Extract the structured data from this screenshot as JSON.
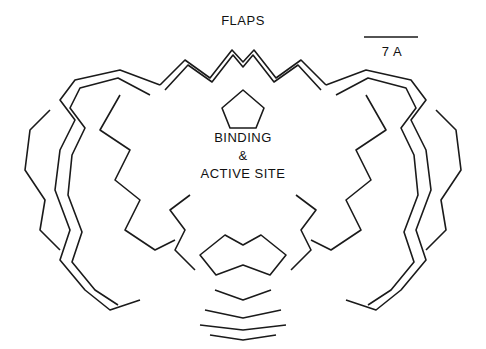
{
  "figure": {
    "top_label": "FLAPS",
    "center_label_line1": "BINDING",
    "center_label_line2": "&",
    "center_label_line3": "ACTIVE SITE",
    "scale_bar_label": "7 A"
  },
  "colors": {
    "trace": "#1a1a1a",
    "background": "#ffffff"
  }
}
